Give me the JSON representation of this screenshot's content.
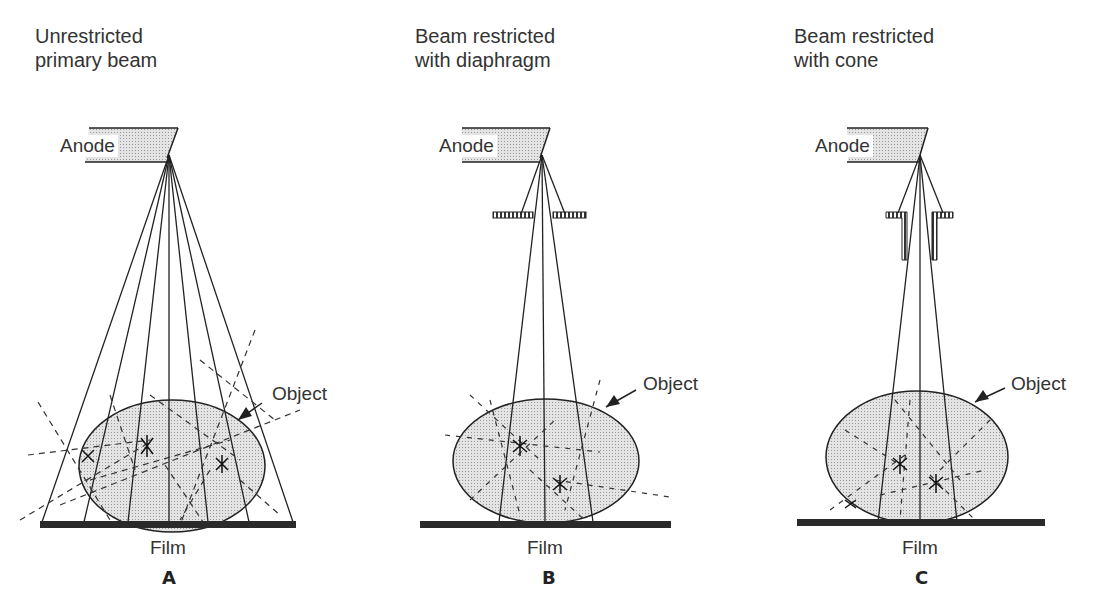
{
  "panels": [
    {
      "id": "A",
      "title": "Unrestricted\nprimary beam",
      "anode_label": "Anode",
      "object_label": "Object",
      "film_label": "Film",
      "letter": "A",
      "restriction": "none"
    },
    {
      "id": "B",
      "title": "Beam restricted\nwith diaphragm",
      "anode_label": "Anode",
      "object_label": "Object",
      "film_label": "Film",
      "letter": "B",
      "restriction": "diaphragm"
    },
    {
      "id": "C",
      "title": "Beam restricted\nwith cone",
      "anode_label": "Anode",
      "object_label": "Object",
      "film_label": "Film",
      "letter": "C",
      "restriction": "cone"
    }
  ],
  "colors": {
    "ink": "#222222",
    "object_fill": "#d9d9d9",
    "film": "#2a2a2a"
  }
}
